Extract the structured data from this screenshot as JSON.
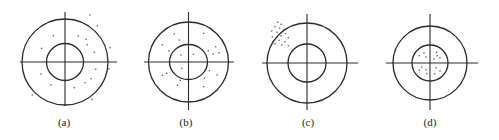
{
  "figure": {
    "panels": [
      {
        "id": "a",
        "label": "(a)",
        "center": [
          65,
          62
        ],
        "outer_r": 43,
        "inner_rx": 18.5,
        "inner_ry": 18.5,
        "h_axis": [
          20,
          117
        ],
        "v_axis": [
          12,
          106
        ],
        "label_pos": [
          64,
          126
        ],
        "dots": [
          [
            90,
            15
          ],
          [
            97.3,
            26
          ],
          [
            78.3,
            36
          ],
          [
            86,
            39.3
          ],
          [
            87.3,
            44.7
          ],
          [
            94.3,
            52.3
          ],
          [
            110,
            47.7
          ],
          [
            95.7,
            69.3
          ],
          [
            109,
            68.7
          ],
          [
            91,
            78.7
          ],
          [
            85,
            82.7
          ],
          [
            74.3,
            87.7
          ],
          [
            92,
            99.3
          ],
          [
            41,
            74
          ],
          [
            51,
            85
          ],
          [
            32.3,
            95
          ],
          [
            46.3,
            100.7
          ],
          [
            41.7,
            48.3
          ],
          [
            53.3,
            35.7
          ]
        ]
      },
      {
        "id": "b",
        "label": "(b)",
        "center": [
          188.5,
          62
        ],
        "outer_r": 40,
        "inner_rx": 19,
        "inner_ry": 17.5,
        "h_axis": [
          144,
          234
        ],
        "v_axis": [
          12,
          110
        ],
        "label_pos": [
          186,
          126
        ],
        "dots": [
          [
            174.3,
            34
          ],
          [
            203.7,
            33.3
          ],
          [
            179.3,
            40
          ],
          [
            162.3,
            44.7
          ],
          [
            169,
            50.7
          ],
          [
            181,
            55
          ],
          [
            193.3,
            54.3
          ],
          [
            208.3,
            50.7
          ],
          [
            215.7,
            46.7
          ],
          [
            213,
            54
          ],
          [
            219,
            52.7
          ],
          [
            181.7,
            68.3
          ],
          [
            162.3,
            75.3
          ],
          [
            166.7,
            73.3
          ],
          [
            180.3,
            80.3
          ],
          [
            177.7,
            85.3
          ],
          [
            204.3,
            78.3
          ],
          [
            209.3,
            70.7
          ],
          [
            217,
            75
          ],
          [
            203.7,
            86.7
          ]
        ]
      },
      {
        "id": "c",
        "label": "(c)",
        "center": [
          307,
          63
        ],
        "outer_r": 40,
        "inner_rx": 19,
        "inner_ry": 19,
        "h_axis": [
          262,
          358
        ],
        "v_axis": [
          14,
          110
        ],
        "label_pos": [
          308,
          126
        ],
        "dots": [
          [
            277.7,
            22.3
          ],
          [
            281,
            24.3
          ],
          [
            275,
            26.7
          ],
          [
            279.7,
            28.3
          ],
          [
            283.7,
            30
          ],
          [
            271.7,
            31
          ],
          [
            277,
            32.3
          ],
          [
            285.7,
            33.7
          ],
          [
            281,
            35.7
          ],
          [
            272.3,
            37
          ],
          [
            288.3,
            37.7
          ],
          [
            279,
            40.3
          ],
          [
            285,
            41.7
          ],
          [
            275,
            43.7
          ],
          [
            281.7,
            45
          ],
          [
            288.3,
            45.7
          ]
        ]
      },
      {
        "id": "d",
        "label": "(d)",
        "center": [
          430,
          63
        ],
        "outer_r": 37,
        "inner_rx": 18,
        "inner_ry": 18,
        "h_axis": [
          386,
          478
        ],
        "v_axis": [
          14,
          110
        ],
        "label_pos": [
          430,
          126
        ],
        "dots": [
          [
            424,
            53
          ],
          [
            419.3,
            55.7
          ],
          [
            426,
            57
          ],
          [
            436.7,
            52.3
          ],
          [
            440,
            57.7
          ],
          [
            434,
            59
          ],
          [
            437.3,
            55.7
          ],
          [
            421.7,
            67
          ],
          [
            426,
            69.7
          ],
          [
            419.3,
            70.3
          ],
          [
            426.7,
            73.7
          ],
          [
            436,
            67.7
          ],
          [
            440,
            71
          ],
          [
            434.7,
            73.7
          ]
        ]
      }
    ],
    "colors": {
      "line": "#2a2a2a",
      "dot": "#555555",
      "label": "#222222",
      "background": "#ffffff"
    }
  }
}
